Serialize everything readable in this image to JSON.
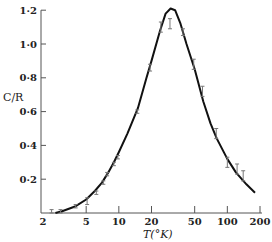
{
  "chart_data": {
    "type": "line",
    "title": "",
    "xlabel": "T(°K)",
    "ylabel": "C/R",
    "xscale": "log",
    "xlim": [
      2,
      200
    ],
    "ylim": [
      0,
      1.2
    ],
    "grid": false,
    "legend": null,
    "x_ticks": [
      2,
      5,
      10,
      20,
      50,
      100,
      200
    ],
    "x_tick_labels": [
      "2",
      "5",
      "10",
      "20",
      "50",
      "100",
      "200"
    ],
    "y_ticks": [
      0.2,
      0.4,
      0.6,
      0.8,
      1.0,
      1.2
    ],
    "y_tick_labels": [
      "0·2",
      "0·4",
      "0·6",
      "0·8",
      "1·0",
      "1·2"
    ],
    "series": [
      {
        "name": "theory curve",
        "style": "solid-line",
        "x": [
          2.6,
          3,
          4,
          5,
          6,
          7,
          8,
          9,
          10,
          12,
          15,
          18,
          20,
          24,
          27,
          30,
          33,
          37,
          42,
          50,
          60,
          70,
          80,
          100,
          120,
          150,
          180
        ],
        "values": [
          0.0,
          0.01,
          0.04,
          0.08,
          0.13,
          0.18,
          0.24,
          0.3,
          0.36,
          0.47,
          0.62,
          0.8,
          0.9,
          1.08,
          1.18,
          1.21,
          1.2,
          1.12,
          1.0,
          0.85,
          0.66,
          0.53,
          0.44,
          0.32,
          0.24,
          0.17,
          0.12
        ]
      },
      {
        "name": "experimental data",
        "style": "error-bars",
        "x": [
          2.4,
          2.9,
          4.0,
          5.1,
          6.2,
          7.2,
          7.8,
          9.0,
          9.8,
          14.8,
          19.4,
          24.4,
          29.6,
          39,
          49,
          59,
          79,
          100,
          123,
          140
        ],
        "values": [
          0.01,
          0.01,
          0.04,
          0.07,
          0.12,
          0.18,
          0.23,
          0.29,
          0.33,
          0.6,
          0.86,
          1.1,
          1.12,
          1.07,
          0.88,
          0.72,
          0.47,
          0.3,
          0.26,
          0.22
        ],
        "err": [
          0.01,
          0.01,
          0.01,
          0.02,
          0.01,
          0.01,
          0.01,
          0.01,
          0.01,
          0.01,
          0.02,
          0.03,
          0.03,
          0.02,
          0.03,
          0.03,
          0.03,
          0.03,
          0.03,
          0.03
        ]
      }
    ]
  },
  "colors": {
    "curve": "#111111",
    "error_bars": "#777777",
    "axis": "#555555"
  }
}
